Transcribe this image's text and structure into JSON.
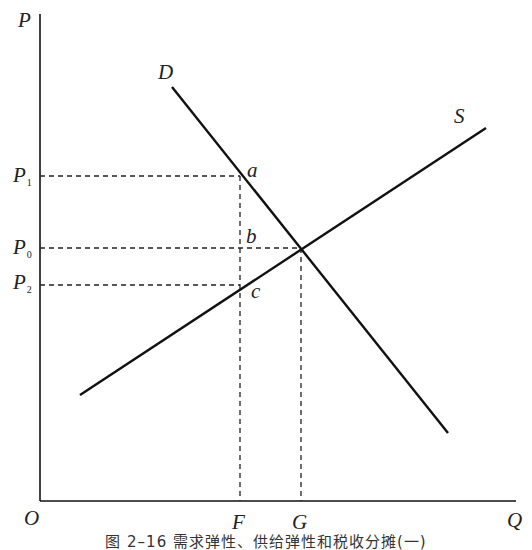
{
  "diagram": {
    "type": "supply-demand",
    "axes": {
      "y_label": "P",
      "x_label": "Q",
      "origin_label": "O"
    },
    "curves": [
      {
        "name": "D",
        "label": "D",
        "from": [
          172,
          87
        ],
        "to": [
          448,
          433
        ]
      },
      {
        "name": "S",
        "label": "S",
        "from": [
          80,
          395
        ],
        "to": [
          486,
          128
        ]
      }
    ],
    "price_levels": [
      {
        "label": "P",
        "sub": "1",
        "y": 176
      },
      {
        "label": "P",
        "sub": "0",
        "y": 248
      },
      {
        "label": "P",
        "sub": "2",
        "y": 285
      }
    ],
    "quantity_levels": [
      {
        "label": "F",
        "x": 240
      },
      {
        "label": "G",
        "x": 301
      }
    ],
    "points": [
      {
        "label": "a",
        "x": 240,
        "y": 176
      },
      {
        "label": "b",
        "x": 240,
        "y": 248
      },
      {
        "label": "c",
        "x": 240,
        "y": 285
      }
    ],
    "caption": "图 2–16   需求弹性、供给弹性和税收分摊(一)"
  },
  "colors": {
    "line": "#111111",
    "dash": "#222222",
    "background": "#ffffff"
  }
}
